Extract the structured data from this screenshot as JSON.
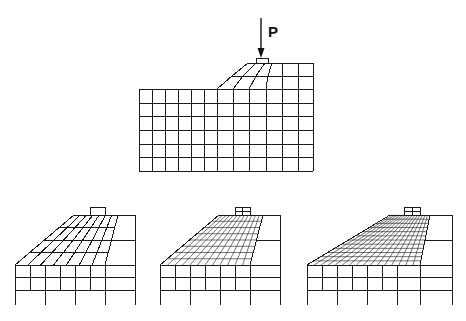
{
  "figure": {
    "width": 466,
    "height": 321,
    "line_color": "#1a1a1a",
    "background": "#ffffff"
  },
  "load": {
    "label": "P",
    "label_pos": [
      268,
      24
    ],
    "arrow": {
      "x": 261,
      "y1": 18,
      "y2": 58
    },
    "pad": {
      "x": 256,
      "y": 58,
      "w": 12,
      "h": 5
    }
  },
  "top_mesh": {
    "description": "Initial coarse finite element mesh of slope with footing load P",
    "base": {
      "left": 139,
      "right": 313,
      "top": 89,
      "bottom": 171
    },
    "rows_y": [
      89,
      103,
      116,
      130,
      144,
      157,
      171
    ],
    "cols_x_base": [
      139,
      152,
      165,
      178,
      191,
      204,
      217,
      233,
      249,
      266,
      282,
      298,
      313
    ],
    "slope": {
      "top_y": 63,
      "mid_y": 76,
      "bottom_y": 89,
      "top_x": [
        248,
        256,
        265,
        272,
        282,
        298,
        313
      ],
      "mid_x": [
        232,
        243,
        256,
        268,
        282,
        298,
        313
      ],
      "bottom_x": [
        217,
        233,
        249,
        266,
        282,
        298,
        313
      ]
    }
  },
  "bottom_meshes": [
    {
      "name": "adapted-mesh-1",
      "left": 15,
      "right": 135,
      "top_y": 215,
      "toe_y": 265,
      "base_y": 290,
      "foot_y": 305,
      "slope_top_left": 74,
      "slope_top_right": 118,
      "pad": {
        "x": 90,
        "y": 207,
        "w": 15,
        "h": 8,
        "split": 0
      },
      "slope_rows": 4,
      "slope_cols": 7,
      "fine_rows_extra": 0,
      "lower_cols_x": [
        15,
        30,
        45,
        60,
        75,
        90,
        105,
        135
      ],
      "lower_rows_y": [
        265,
        277,
        290
      ],
      "foot_cols_x": [
        15,
        45,
        75,
        105,
        135
      ]
    },
    {
      "name": "adapted-mesh-2",
      "left": 160,
      "right": 280,
      "top_y": 215,
      "toe_y": 265,
      "base_y": 290,
      "foot_y": 305,
      "slope_top_left": 219,
      "slope_top_right": 263,
      "pad": {
        "x": 235,
        "y": 207,
        "w": 15,
        "h": 8,
        "split": 2
      },
      "slope_rows": 8,
      "slope_cols": 12,
      "fine_rows_extra": 1,
      "lower_cols_x": [
        160,
        175,
        190,
        205,
        220,
        235,
        250,
        280
      ],
      "lower_rows_y": [
        265,
        277,
        290
      ],
      "foot_cols_x": [
        160,
        190,
        220,
        250,
        280
      ]
    },
    {
      "name": "adapted-mesh-3",
      "left": 307,
      "right": 452,
      "top_y": 215,
      "toe_y": 265,
      "base_y": 290,
      "foot_y": 305,
      "slope_top_left": 390,
      "slope_top_right": 430,
      "pad": {
        "x": 404,
        "y": 207,
        "w": 16,
        "h": 8,
        "split": 2
      },
      "slope_rows": 12,
      "slope_cols": 16,
      "fine_rows_extra": 2,
      "lower_cols_x": [
        307,
        322,
        337,
        352,
        367,
        382,
        397,
        420,
        452
      ],
      "lower_rows_y": [
        265,
        277,
        290
      ],
      "foot_cols_x": [
        307,
        337,
        367,
        397,
        420,
        452
      ]
    }
  ]
}
